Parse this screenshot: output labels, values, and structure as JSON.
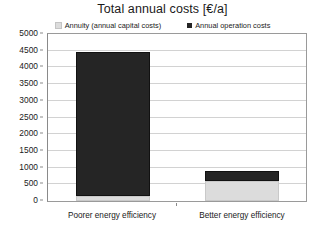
{
  "chart_data": {
    "type": "bar",
    "subtype": "stacked",
    "title": "Total annual costs [€/a]",
    "xlabel": "",
    "ylabel": "",
    "categories": [
      "Poorer energy efficiency",
      "Better energy efficiency"
    ],
    "series": [
      {
        "name": "Annuity (annual capital costs)",
        "color": "#dcdcdc",
        "values": [
          150,
          600
        ]
      },
      {
        "name": "Annual operation costs",
        "color": "#252525",
        "values": [
          4300,
          300
        ]
      }
    ],
    "totals": [
      4450,
      900
    ],
    "ylim": [
      0,
      5000
    ],
    "ytick_step": 500,
    "yticks": [
      5000,
      4500,
      4000,
      3500,
      3000,
      2500,
      2000,
      1500,
      1000,
      500,
      0
    ],
    "ytick_labels": [
      "5000",
      "4500",
      "4000",
      "3500",
      "3000",
      "2500",
      "2000",
      "1500",
      "1000",
      "500",
      "0"
    ],
    "grid": true,
    "grid_axis": "y",
    "legend_position": "top",
    "plot_border_color": "#9a9a9a",
    "gridline_color": "#d2d2d2",
    "background": "#ffffff",
    "text_color": "#1a1a1a"
  }
}
